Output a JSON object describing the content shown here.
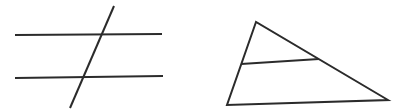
{
  "canvas": {
    "width": 401,
    "height": 112,
    "background_color": "#ffffff",
    "stroke_color": "#2b2b2b",
    "stroke_width": 2
  },
  "figures": {
    "parallel_lines_with_transversal": {
      "description": "Two horizontal parallel lines cut by a slanted transversal",
      "lines": [
        {
          "name": "parallel-line-top",
          "x1": 15,
          "y1": 35,
          "x2": 162,
          "y2": 34
        },
        {
          "name": "parallel-line-bottom",
          "x1": 15,
          "y1": 78,
          "x2": 163,
          "y2": 76
        },
        {
          "name": "transversal-line",
          "x1": 114,
          "y1": 6,
          "x2": 70,
          "y2": 108
        }
      ]
    },
    "triangle_with_midsegment": {
      "description": "Scalene triangle with an interior segment parallel to its base",
      "polygon": {
        "name": "triangle-outline",
        "points": [
          [
            256,
            22
          ],
          [
            227,
            105
          ],
          [
            388,
            100
          ]
        ]
      },
      "lines": [
        {
          "name": "midsegment-line",
          "x1": 241,
          "y1": 64,
          "x2": 319,
          "y2": 59
        }
      ]
    }
  }
}
